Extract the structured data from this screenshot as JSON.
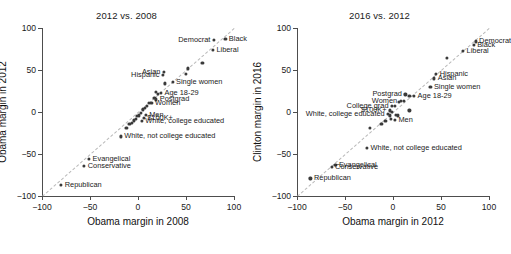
{
  "figure": {
    "width": 507,
    "height": 254,
    "point_color": "#3a3a3a",
    "axis_color": "#4d4d4d",
    "reference_line_color": "#b9b9b9"
  },
  "chart_data": [
    {
      "type": "scatter",
      "title": "2012 vs. 2008",
      "xlabel": "Obama margin in 2008",
      "ylabel": "Obama margin in 2012",
      "xlim": [
        -100,
        100
      ],
      "ylim": [
        -100,
        100
      ],
      "xticks": [
        -100,
        -50,
        0,
        50,
        100
      ],
      "yticks": [
        -100,
        -50,
        0,
        50,
        100
      ],
      "grid": false,
      "legend": "none",
      "annotations": [
        "y = x reference line (dashed)"
      ],
      "points": [
        {
          "label": "Black",
          "x": 91,
          "y": 87,
          "side": "left"
        },
        {
          "label": "Democrat",
          "x": 79,
          "y": 86,
          "side": "right"
        },
        {
          "label": "Liberal",
          "x": 78,
          "y": 74,
          "side": "left"
        },
        {
          "label": "",
          "x": 67,
          "y": 58,
          "side": "left"
        },
        {
          "label": "",
          "x": 52,
          "y": 52,
          "side": "left"
        },
        {
          "label": "",
          "x": 50,
          "y": 45,
          "side": "left"
        },
        {
          "label": "Asian",
          "x": 27,
          "y": 48,
          "side": "right"
        },
        {
          "label": "Hispanic",
          "x": 26,
          "y": 44,
          "side": "right"
        },
        {
          "label": "Single women",
          "x": 36,
          "y": 36,
          "side": "left"
        },
        {
          "label": "",
          "x": 28,
          "y": 34,
          "side": "left"
        },
        {
          "label": "Age 18-29",
          "x": 24,
          "y": 23,
          "side": "left"
        },
        {
          "label": "",
          "x": 19,
          "y": 24,
          "side": "left"
        },
        {
          "label": "",
          "x": 21,
          "y": 22,
          "side": "left"
        },
        {
          "label": "Postgrad",
          "x": 19,
          "y": 15,
          "side": "left"
        },
        {
          "label": "",
          "x": 17,
          "y": 17,
          "side": "left"
        },
        {
          "label": "Women",
          "x": 14,
          "y": 11,
          "side": "left"
        },
        {
          "label": "",
          "x": 11,
          "y": 11,
          "side": "left"
        },
        {
          "label": "",
          "x": 9,
          "y": 7,
          "side": "left"
        },
        {
          "label": "",
          "x": 7,
          "y": 5,
          "side": "left"
        },
        {
          "label": "",
          "x": 5,
          "y": 3,
          "side": "left"
        },
        {
          "label": "Men",
          "x": 8,
          "y": -3,
          "side": "left"
        },
        {
          "label": "",
          "x": 3,
          "y": -1,
          "side": "left"
        },
        {
          "label": "$100K+",
          "x": 6,
          "y": -7,
          "side": "left"
        },
        {
          "label": "",
          "x": 1,
          "y": -4,
          "side": "left"
        },
        {
          "label": "",
          "x": -1,
          "y": -5,
          "side": "left"
        },
        {
          "label": "",
          "x": -2,
          "y": -8,
          "side": "left"
        },
        {
          "label": "White, college educated",
          "x": 4,
          "y": -11,
          "side": "left"
        },
        {
          "label": "",
          "x": -4,
          "y": -10,
          "side": "left"
        },
        {
          "label": "",
          "x": -6,
          "y": -13,
          "side": "left"
        },
        {
          "label": "",
          "x": -9,
          "y": -14,
          "side": "left"
        },
        {
          "label": "",
          "x": -12,
          "y": -19,
          "side": "left"
        },
        {
          "label": "White, not college educated",
          "x": -18,
          "y": -29,
          "side": "left"
        },
        {
          "label": "Evangelical",
          "x": -51,
          "y": -56,
          "side": "left"
        },
        {
          "label": "Conservative",
          "x": -56,
          "y": -64,
          "side": "left"
        },
        {
          "label": "Republican",
          "x": -80,
          "y": -87,
          "side": "left"
        }
      ]
    },
    {
      "type": "scatter",
      "title": "2016 vs. 2012",
      "xlabel": "Obama margin in 2012",
      "ylabel": "Clinton margin in 2016",
      "xlim": [
        -100,
        100
      ],
      "ylim": [
        -100,
        100
      ],
      "xticks": [
        -100,
        -50,
        0,
        50,
        100
      ],
      "yticks": [
        -100,
        -50,
        0,
        50,
        100
      ],
      "grid": false,
      "legend": "none",
      "annotations": [
        "y = x reference line (dashed)"
      ],
      "points": [
        {
          "label": "Democrat",
          "x": 86,
          "y": 84,
          "side": "left"
        },
        {
          "label": "Black",
          "x": 84,
          "y": 80,
          "side": "left"
        },
        {
          "label": "Liberal",
          "x": 73,
          "y": 73,
          "side": "left"
        },
        {
          "label": "",
          "x": 56,
          "y": 64,
          "side": "left"
        },
        {
          "label": "Hispanic",
          "x": 45,
          "y": 45,
          "side": "left"
        },
        {
          "label": "Asian",
          "x": 43,
          "y": 40,
          "side": "left"
        },
        {
          "label": "Single women",
          "x": 39,
          "y": 30,
          "side": "left"
        },
        {
          "label": "Age 18-29",
          "x": 22,
          "y": 19,
          "side": "left"
        },
        {
          "label": "Postgrad",
          "x": 13,
          "y": 21,
          "side": "right"
        },
        {
          "label": "",
          "x": 17,
          "y": 19,
          "side": "left"
        },
        {
          "label": "Women",
          "x": 8,
          "y": 13,
          "side": "right"
        },
        {
          "label": "",
          "x": 11,
          "y": 13,
          "side": "left"
        },
        {
          "label": "",
          "x": 6,
          "y": 12,
          "side": "left"
        },
        {
          "label": "College grad",
          "x": -1,
          "y": 7,
          "side": "right"
        },
        {
          "label": "",
          "x": 2,
          "y": 7,
          "side": "left"
        },
        {
          "label": "$100K+",
          "x": -3,
          "y": 2,
          "side": "right"
        },
        {
          "label": "",
          "x": 17,
          "y": 2,
          "side": "left"
        },
        {
          "label": "",
          "x": -1,
          "y": 0,
          "side": "left"
        },
        {
          "label": "White, college educated",
          "x": -5,
          "y": -2,
          "side": "right"
        },
        {
          "label": "",
          "x": -3,
          "y": -4,
          "side": "left"
        },
        {
          "label": "",
          "x": 3,
          "y": -3,
          "side": "left"
        },
        {
          "label": "",
          "x": 5,
          "y": -4,
          "side": "left"
        },
        {
          "label": "Men",
          "x": 2,
          "y": -9,
          "side": "left"
        },
        {
          "label": "",
          "x": -2,
          "y": -8,
          "side": "left"
        },
        {
          "label": "",
          "x": -8,
          "y": -11,
          "side": "left"
        },
        {
          "label": "",
          "x": -12,
          "y": -14,
          "side": "left"
        },
        {
          "label": "",
          "x": -24,
          "y": -19,
          "side": "left"
        },
        {
          "label": "White, not college educated",
          "x": -27,
          "y": -43,
          "side": "left"
        },
        {
          "label": "Evangelical",
          "x": -60,
          "y": -63,
          "side": "left"
        },
        {
          "label": "Conservative",
          "x": -64,
          "y": -65,
          "side": "left"
        },
        {
          "label": "Republican",
          "x": -86,
          "y": -79,
          "side": "left"
        }
      ]
    }
  ]
}
